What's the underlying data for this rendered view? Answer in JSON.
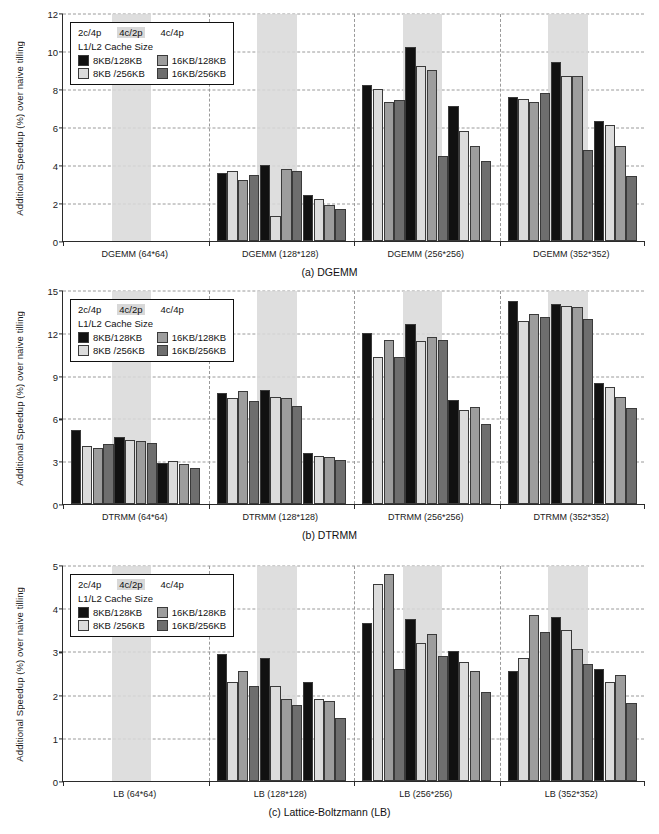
{
  "figure": {
    "ylabel": "Additional Speedup (%) over naive tilling"
  },
  "legend": {
    "configs": [
      "2c/4p",
      "4c/2p",
      "4c/4p"
    ],
    "highlighted_config": "4c/2p",
    "title": "L1/L2 Cache Size",
    "items": [
      {
        "label": "8KB/128KB",
        "color": "#111111"
      },
      {
        "label": "16KB/128KB",
        "color": "#9d9d9d"
      },
      {
        "label": "8KB /256KB",
        "color": "#dcdcdc"
      },
      {
        "label": "16KB/256KB",
        "color": "#6e6e6e"
      }
    ]
  },
  "chart_data": [
    {
      "type": "bar",
      "title": "(a) DGEMM",
      "xlabel": "",
      "ylabel": "Additional Speedup (%) over naive tilling",
      "ylim": [
        0,
        12
      ],
      "yticks": [
        0,
        2,
        4,
        6,
        8,
        10,
        12
      ],
      "grid": true,
      "legend_position": "upper-left",
      "categories": [
        "DGEMM (64*64)",
        "DGEMM (128*128)",
        "DGEMM (256*256)",
        "DGEMM (352*352)"
      ],
      "configs": [
        "2c/4p",
        "4c/2p",
        "4c/4p"
      ],
      "series": [
        {
          "name": "8KB/128KB",
          "values": [
            [
              0,
              3.6,
              8.2,
              7.6
            ],
            [
              4.0,
              10.2,
              9.4
            ],
            [
              2.4,
              7.1,
              6.3
            ]
          ]
        },
        {
          "name": "8KB /256KB",
          "values": [
            [
              0,
              3.7,
              8.0,
              7.5
            ],
            [
              1.3,
              9.2,
              8.7
            ],
            [
              2.2,
              5.8,
              6.1
            ]
          ]
        },
        {
          "name": "16KB/128KB",
          "values": [
            [
              0,
              3.2,
              7.3,
              7.3
            ],
            [
              3.8,
              9.0,
              8.7
            ],
            [
              1.9,
              5.0,
              5.0
            ]
          ]
        },
        {
          "name": "16KB/256KB",
          "values": [
            [
              0,
              3.5,
              7.4,
              7.8
            ],
            [
              3.7,
              4.5,
              4.8
            ],
            [
              1.7,
              4.2,
              3.4
            ]
          ]
        }
      ],
      "note_empty_group": "DGEMM (64*64) has no measurable speedup"
    },
    {
      "type": "bar",
      "title": "(b) DTRMM",
      "xlabel": "",
      "ylabel": "Additional Speedup (%) over naive tilling",
      "ylim": [
        0,
        15
      ],
      "yticks": [
        0,
        3,
        6,
        9,
        12,
        15
      ],
      "grid": true,
      "legend_position": "upper-left",
      "categories": [
        "DTRMM (64*64)",
        "DTRMM (128*128)",
        "DTRMM (256*256)",
        "DTRMM (352*352)"
      ],
      "configs": [
        "2c/4p",
        "4c/2p",
        "4c/4p"
      ],
      "series": [
        {
          "name": "8KB/128KB",
          "values": [
            [
              5.2,
              7.8,
              12.0,
              14.2
            ],
            [
              4.7,
              8.0,
              12.6,
              14.0
            ]
          ]
        },
        {
          "name": "8KB /256KB",
          "values": [
            [
              4.1,
              7.4,
              10.3,
              12.8
            ],
            [
              4.5,
              7.5,
              11.4,
              13.9
            ]
          ]
        },
        {
          "name": "16KB/128KB",
          "values": [
            [
              3.9,
              7.9,
              11.5,
              13.3
            ],
            [
              4.4,
              7.4,
              11.7,
              13.8
            ]
          ]
        },
        {
          "name": "16KB/256KB",
          "values": [
            [
              4.2,
              7.2,
              10.3,
              13.1
            ],
            [
              4.3,
              6.9,
              11.5,
              13.0
            ]
          ]
        },
        {
          "name": "4c4p-8KB/128KB",
          "values": [
            2.9,
            3.6,
            7.3,
            8.5
          ]
        },
        {
          "name": "4c4p-8KB /256KB",
          "values": [
            3.0,
            3.4,
            6.6,
            8.2
          ]
        },
        {
          "name": "4c4p-16KB/128KB",
          "values": [
            2.8,
            3.3,
            6.8,
            7.5
          ]
        },
        {
          "name": "4c4p-16KB/256KB",
          "values": [
            2.5,
            3.1,
            5.6,
            6.7
          ]
        }
      ]
    },
    {
      "type": "bar",
      "title": "(c) Lattice-Boltzmann (LB)",
      "xlabel": "",
      "ylabel": "Additional Speedup (%) over naive tilling",
      "ylim": [
        0,
        5
      ],
      "yticks": [
        0,
        1,
        2,
        3,
        4,
        5
      ],
      "grid": true,
      "legend_position": "upper-left",
      "categories": [
        "LB (64*64)",
        "LB (128*128)",
        "LB (256*256)",
        "LB (352*352)"
      ],
      "configs": [
        "2c/4p",
        "4c/2p",
        "4c/4p"
      ],
      "series": [
        {
          "name": "8KB/128KB",
          "values": [
            [
              0,
              2.95,
              3.65,
              2.55
            ],
            [
              2.85,
              4.75,
              3.8
            ],
            [
              2.3,
              2.6,
              2.45
            ]
          ]
        },
        {
          "name": "8KB /256KB",
          "values": [
            [
              0,
              2.3,
              4.55,
              2.85
            ],
            [
              2.2,
              4.85,
              3.9
            ],
            [
              1.9,
              2.55,
              2.3
            ]
          ]
        },
        {
          "name": "16KB/128KB",
          "values": [
            [
              0,
              2.55,
              3.4,
              3.85
            ],
            [
              1.9,
              3.75,
              3.55
            ],
            [
              1.85,
              2.45,
              2.15
            ]
          ]
        },
        {
          "name": "16KB/256KB",
          "values": [
            [
              0,
              2.2,
              2.6,
              3.45
            ],
            [
              1.75,
              2.9,
              2.7
            ],
            [
              1.45,
              2.05,
              1.8
            ]
          ]
        }
      ],
      "note_empty_group": "LB (64*64) has no measurable speedup"
    }
  ],
  "panels": [
    {
      "id": "dgemm",
      "caption": "(a) DGEMM",
      "ymin": 0,
      "ymax": 12,
      "yticks": [
        "0",
        "2",
        "4",
        "6",
        "8",
        "10",
        "12"
      ],
      "groups": [
        {
          "label": "DGEMM (64*64)",
          "bars": [
            {
              "v": 0,
              "c": 0
            },
            {
              "v": 0,
              "c": 1
            },
            {
              "v": 0,
              "c": 2
            },
            {
              "v": 0,
              "c": 3
            },
            {
              "v": 0,
              "c": 0
            },
            {
              "v": 0,
              "c": 1
            },
            {
              "v": 0,
              "c": 2
            },
            {
              "v": 0,
              "c": 3
            },
            {
              "v": 0,
              "c": 0
            },
            {
              "v": 0,
              "c": 1
            },
            {
              "v": 0,
              "c": 2
            },
            {
              "v": 0,
              "c": 3
            }
          ]
        },
        {
          "label": "DGEMM (128*128)",
          "bars": [
            {
              "v": 3.6,
              "c": 0
            },
            {
              "v": 3.7,
              "c": 1
            },
            {
              "v": 3.2,
              "c": 2
            },
            {
              "v": 3.5,
              "c": 3
            },
            {
              "v": 4.0,
              "c": 0
            },
            {
              "v": 1.3,
              "c": 1
            },
            {
              "v": 3.8,
              "c": 2
            },
            {
              "v": 3.7,
              "c": 3
            },
            {
              "v": 2.4,
              "c": 0
            },
            {
              "v": 2.2,
              "c": 1
            },
            {
              "v": 1.9,
              "c": 2
            },
            {
              "v": 1.7,
              "c": 3
            }
          ]
        },
        {
          "label": "DGEMM (256*256)",
          "bars": [
            {
              "v": 8.2,
              "c": 0
            },
            {
              "v": 8.0,
              "c": 1
            },
            {
              "v": 7.3,
              "c": 2
            },
            {
              "v": 7.4,
              "c": 3
            },
            {
              "v": 10.2,
              "c": 0
            },
            {
              "v": 9.2,
              "c": 1
            },
            {
              "v": 9.0,
              "c": 2
            },
            {
              "v": 4.5,
              "c": 3
            },
            {
              "v": 7.1,
              "c": 0
            },
            {
              "v": 5.8,
              "c": 1
            },
            {
              "v": 5.0,
              "c": 2
            },
            {
              "v": 4.2,
              "c": 3
            }
          ]
        },
        {
          "label": "DGEMM (352*352)",
          "bars": [
            {
              "v": 7.6,
              "c": 0
            },
            {
              "v": 7.5,
              "c": 1
            },
            {
              "v": 7.3,
              "c": 2
            },
            {
              "v": 7.8,
              "c": 3
            },
            {
              "v": 9.4,
              "c": 0
            },
            {
              "v": 8.7,
              "c": 1
            },
            {
              "v": 8.7,
              "c": 2
            },
            {
              "v": 4.8,
              "c": 3
            },
            {
              "v": 6.3,
              "c": 0
            },
            {
              "v": 6.1,
              "c": 1
            },
            {
              "v": 5.0,
              "c": 2
            },
            {
              "v": 3.4,
              "c": 3
            }
          ]
        }
      ]
    },
    {
      "id": "dtrmm",
      "caption": "(b) DTRMM",
      "ymin": 0,
      "ymax": 15,
      "yticks": [
        "0",
        "3",
        "6",
        "9",
        "12",
        "15"
      ],
      "groups": [
        {
          "label": "DTRMM (64*64)",
          "bars": [
            {
              "v": 5.2,
              "c": 0
            },
            {
              "v": 4.1,
              "c": 1
            },
            {
              "v": 3.9,
              "c": 2
            },
            {
              "v": 4.2,
              "c": 3
            },
            {
              "v": 4.7,
              "c": 0
            },
            {
              "v": 4.5,
              "c": 1
            },
            {
              "v": 4.4,
              "c": 2
            },
            {
              "v": 4.3,
              "c": 3
            },
            {
              "v": 2.9,
              "c": 0
            },
            {
              "v": 3.0,
              "c": 1
            },
            {
              "v": 2.8,
              "c": 2
            },
            {
              "v": 2.5,
              "c": 3
            }
          ]
        },
        {
          "label": "DTRMM (128*128)",
          "bars": [
            {
              "v": 7.8,
              "c": 0
            },
            {
              "v": 7.4,
              "c": 1
            },
            {
              "v": 7.9,
              "c": 2
            },
            {
              "v": 7.2,
              "c": 3
            },
            {
              "v": 8.0,
              "c": 0
            },
            {
              "v": 7.5,
              "c": 1
            },
            {
              "v": 7.4,
              "c": 2
            },
            {
              "v": 6.9,
              "c": 3
            },
            {
              "v": 3.6,
              "c": 0
            },
            {
              "v": 3.4,
              "c": 1
            },
            {
              "v": 3.3,
              "c": 2
            },
            {
              "v": 3.1,
              "c": 3
            }
          ]
        },
        {
          "label": "DTRMM (256*256)",
          "bars": [
            {
              "v": 12.0,
              "c": 0
            },
            {
              "v": 10.3,
              "c": 1
            },
            {
              "v": 11.5,
              "c": 2
            },
            {
              "v": 10.3,
              "c": 3
            },
            {
              "v": 12.6,
              "c": 0
            },
            {
              "v": 11.4,
              "c": 1
            },
            {
              "v": 11.7,
              "c": 2
            },
            {
              "v": 11.5,
              "c": 3
            },
            {
              "v": 7.3,
              "c": 0
            },
            {
              "v": 6.6,
              "c": 1
            },
            {
              "v": 6.8,
              "c": 2
            },
            {
              "v": 5.6,
              "c": 3
            }
          ]
        },
        {
          "label": "DTRMM (352*352)",
          "bars": [
            {
              "v": 14.2,
              "c": 0
            },
            {
              "v": 12.8,
              "c": 1
            },
            {
              "v": 13.3,
              "c": 2
            },
            {
              "v": 13.1,
              "c": 3
            },
            {
              "v": 14.0,
              "c": 0
            },
            {
              "v": 13.9,
              "c": 1
            },
            {
              "v": 13.8,
              "c": 2
            },
            {
              "v": 13.0,
              "c": 3
            },
            {
              "v": 8.5,
              "c": 0
            },
            {
              "v": 8.2,
              "c": 1
            },
            {
              "v": 7.5,
              "c": 2
            },
            {
              "v": 6.7,
              "c": 3
            }
          ]
        }
      ]
    },
    {
      "id": "lb",
      "caption": "(c) Lattice-Boltzmann (LB)",
      "ymin": 0,
      "ymax": 5,
      "yticks": [
        "0",
        "1",
        "2",
        "3",
        "4",
        "5"
      ],
      "groups": [
        {
          "label": "LB (64*64)",
          "bars": [
            {
              "v": 0,
              "c": 0
            },
            {
              "v": 0,
              "c": 1
            },
            {
              "v": 0,
              "c": 2
            },
            {
              "v": 0,
              "c": 3
            },
            {
              "v": 0,
              "c": 0
            },
            {
              "v": 0,
              "c": 1
            },
            {
              "v": 0,
              "c": 2
            },
            {
              "v": 0,
              "c": 3
            },
            {
              "v": 0,
              "c": 0
            },
            {
              "v": 0,
              "c": 1
            },
            {
              "v": 0,
              "c": 2
            },
            {
              "v": 0,
              "c": 3
            }
          ]
        },
        {
          "label": "LB (128*128)",
          "bars": [
            {
              "v": 2.95,
              "c": 0
            },
            {
              "v": 2.3,
              "c": 1
            },
            {
              "v": 2.55,
              "c": 2
            },
            {
              "v": 2.2,
              "c": 3
            },
            {
              "v": 2.85,
              "c": 0
            },
            {
              "v": 2.2,
              "c": 1
            },
            {
              "v": 1.9,
              "c": 2
            },
            {
              "v": 1.75,
              "c": 3
            },
            {
              "v": 2.3,
              "c": 0
            },
            {
              "v": 1.9,
              "c": 1
            },
            {
              "v": 1.85,
              "c": 2
            },
            {
              "v": 1.45,
              "c": 3
            }
          ]
        },
        {
          "label": "LB (256*256)",
          "bars": [
            {
              "v": 3.65,
              "c": 0
            },
            {
              "v": 4.55,
              "c": 1
            },
            {
              "v": 4.8,
              "c": 2
            },
            {
              "v": 2.6,
              "c": 3
            },
            {
              "v": 3.75,
              "c": 0
            },
            {
              "v": 3.2,
              "c": 1
            },
            {
              "v": 3.4,
              "c": 2
            },
            {
              "v": 2.9,
              "c": 3
            },
            {
              "v": 3.0,
              "c": 0
            },
            {
              "v": 2.75,
              "c": 1
            },
            {
              "v": 2.55,
              "c": 2
            },
            {
              "v": 2.05,
              "c": 3
            }
          ]
        },
        {
          "label": "LB (352*352)",
          "bars": [
            {
              "v": 2.55,
              "c": 0
            },
            {
              "v": 2.85,
              "c": 1
            },
            {
              "v": 3.85,
              "c": 2
            },
            {
              "v": 3.45,
              "c": 3
            },
            {
              "v": 3.8,
              "c": 0
            },
            {
              "v": 3.5,
              "c": 1
            },
            {
              "v": 3.05,
              "c": 2
            },
            {
              "v": 2.7,
              "c": 3
            },
            {
              "v": 2.6,
              "c": 0
            },
            {
              "v": 2.3,
              "c": 1
            },
            {
              "v": 2.45,
              "c": 2
            },
            {
              "v": 1.8,
              "c": 3
            }
          ]
        }
      ]
    }
  ]
}
